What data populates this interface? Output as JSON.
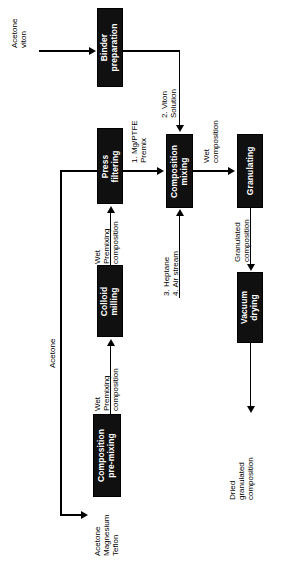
{
  "diagram": {
    "orientation": "rotated-90",
    "colors": {
      "box_fill": "#101010",
      "box_text": "#ffffff",
      "line": "#000000",
      "background": "#ffffff"
    },
    "nodes": [
      {
        "id": "binder_preparation",
        "label_lines": [
          "Binder",
          "preparation"
        ]
      },
      {
        "id": "press_filtering",
        "label_lines": [
          "Press",
          "filtering"
        ]
      },
      {
        "id": "composition_mixing",
        "label_lines": [
          "Composition",
          "mixing"
        ]
      },
      {
        "id": "granulating",
        "label_lines": [
          "Granulating"
        ]
      },
      {
        "id": "colloid_milling",
        "label_lines": [
          "Colloid",
          "milling"
        ]
      },
      {
        "id": "vacuum_drying",
        "label_lines": [
          "Vacuum",
          "drying"
        ]
      },
      {
        "id": "composition_pre_mixing",
        "label_lines": [
          "Composition",
          "pre-mixing"
        ]
      }
    ],
    "edge_labels": [
      {
        "id": "acetone_viton_feed",
        "lines": [
          "Acetone",
          "viton"
        ]
      },
      {
        "id": "viton_solution",
        "lines": [
          "2. Viton",
          "Solution"
        ]
      },
      {
        "id": "mg_ptfe_premix",
        "lines": [
          "1. Mg/PTFE",
          "Premix"
        ]
      },
      {
        "id": "wet_composition",
        "lines": [
          "Wet",
          "composition"
        ]
      },
      {
        "id": "heptane_air_stream",
        "lines": [
          "3. Heptane",
          "4. Air stream"
        ]
      },
      {
        "id": "granulated_composition",
        "lines": [
          "Granulated",
          "composition"
        ]
      },
      {
        "id": "dried_granulated_composition",
        "lines": [
          "Dried",
          "granulated",
          "composition"
        ]
      },
      {
        "id": "wet_premixing_composition_top",
        "lines": [
          "Wet",
          "Premixing",
          "composition"
        ]
      },
      {
        "id": "wet_premixing_composition_bottom",
        "lines": [
          "Wet",
          "Premixing",
          "composition"
        ]
      },
      {
        "id": "acetone_recycle",
        "lines": [
          "Acetone"
        ]
      },
      {
        "id": "acetone_magnesium_teflon",
        "lines": [
          "Acetone",
          "Magnesium",
          "Teflon"
        ]
      }
    ]
  }
}
